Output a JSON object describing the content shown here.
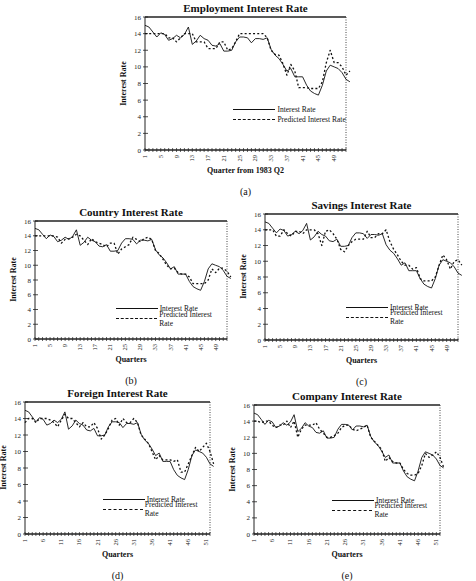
{
  "figure": {
    "captions": [
      "(a)",
      "(b)",
      "(c)",
      "(d)",
      "(e)"
    ]
  },
  "legend": {
    "actual": "Interest Rate",
    "predicted": "Predicted Interest Rate"
  },
  "chart_data": [
    {
      "id": "a",
      "type": "line",
      "title": "Employment Interest Rate",
      "xlabel": "Quarter from 1983 Q2",
      "ylabel": "Interest Rate",
      "caption": "(a)",
      "ylim": [
        0,
        16
      ],
      "yticks": [
        0,
        2,
        4,
        6,
        8,
        10,
        12,
        14,
        16
      ],
      "xlim": [
        1,
        52
      ],
      "xticks": [
        1,
        5,
        9,
        13,
        17,
        21,
        25,
        29,
        33,
        37,
        41,
        45,
        49
      ],
      "grid": false,
      "legend_position": "lower-center",
      "box": {
        "left": 145,
        "top": 17,
        "right": 346,
        "bottom": 150
      },
      "series": [
        {
          "name": "Interest Rate",
          "style": "solid",
          "values": [
            15.0,
            14.8,
            14.2,
            13.6,
            14.1,
            13.9,
            13.2,
            13.4,
            13.8,
            13.5,
            13.9,
            14.8,
            12.7,
            13.1,
            13.8,
            13.4,
            13.2,
            12.6,
            12.5,
            12.8,
            11.9,
            11.9,
            12.0,
            13.0,
            13.6,
            13.6,
            13.5,
            12.9,
            13.4,
            13.4,
            13.3,
            13.5,
            12.1,
            11.4,
            11.0,
            10.3,
            9.5,
            9.8,
            8.8,
            8.8,
            8.8,
            7.8,
            7.1,
            6.8,
            6.6,
            7.8,
            9.5,
            10.2,
            10.0,
            9.8,
            9.3,
            8.5,
            8.2
          ]
        },
        {
          "name": "Predicted Interest Rate",
          "style": "dashed",
          "values": [
            14.0,
            14.0,
            14.0,
            14.0,
            14.0,
            14.0,
            13.5,
            13.5,
            13.0,
            13.5,
            14.0,
            14.0,
            14.0,
            13.0,
            13.0,
            13.0,
            12.2,
            12.2,
            12.2,
            13.0,
            13.0,
            12.0,
            12.2,
            13.0,
            14.0,
            14.0,
            14.0,
            14.0,
            14.0,
            14.0,
            14.0,
            13.5,
            12.0,
            11.5,
            11.4,
            10.4,
            9.0,
            10.3,
            9.5,
            7.5,
            7.5,
            7.5,
            7.4,
            7.4,
            7.4,
            8.2,
            10.5,
            12.0,
            10.5,
            10.5,
            10.0,
            9.0,
            9.5
          ]
        }
      ]
    },
    {
      "id": "b",
      "type": "line",
      "title": "Country Interest Rate",
      "xlabel": "Quarters",
      "ylabel": "Interest Rate",
      "caption": "(b)",
      "ylim": [
        0,
        16
      ],
      "yticks": [
        0,
        2,
        4,
        6,
        8,
        10,
        12,
        14,
        16
      ],
      "xlim": [
        1,
        52
      ],
      "xticks": [
        1,
        5,
        9,
        13,
        17,
        21,
        25,
        29,
        33,
        37,
        41,
        45,
        49
      ],
      "grid": false,
      "legend_position": "lower-right",
      "box": {
        "left": 35,
        "top": 221,
        "right": 227,
        "bottom": 339
      },
      "series": [
        {
          "name": "Interest Rate",
          "style": "solid",
          "values": [
            15.0,
            14.8,
            14.2,
            13.6,
            14.1,
            13.9,
            13.2,
            13.4,
            13.8,
            13.5,
            13.9,
            14.8,
            12.7,
            13.1,
            13.8,
            13.4,
            13.2,
            12.6,
            12.5,
            12.8,
            11.9,
            11.9,
            12.0,
            13.0,
            13.6,
            13.6,
            13.5,
            12.9,
            13.4,
            13.4,
            13.3,
            13.5,
            12.1,
            11.4,
            11.0,
            10.3,
            9.5,
            9.8,
            8.8,
            8.8,
            8.8,
            7.8,
            7.1,
            6.8,
            6.6,
            7.8,
            9.5,
            10.2,
            10.0,
            9.8,
            9.3,
            8.5,
            8.2
          ]
        },
        {
          "name": "Predicted Interest Rate",
          "style": "dashed",
          "values": [
            14.0,
            14.0,
            14.0,
            14.0,
            14.0,
            14.0,
            13.8,
            13.0,
            13.5,
            13.6,
            13.8,
            14.2,
            14.0,
            13.4,
            12.8,
            13.6,
            13.2,
            13.0,
            12.8,
            12.5,
            13.0,
            13.0,
            11.5,
            12.2,
            12.5,
            12.8,
            13.8,
            13.5,
            13.2,
            13.6,
            13.8,
            13.5,
            12.0,
            11.6,
            10.8,
            10.0,
            9.5,
            9.6,
            9.0,
            8.8,
            8.8,
            8.4,
            7.5,
            7.5,
            7.5,
            7.5,
            8.0,
            9.5,
            9.0,
            9.6,
            9.6,
            9.2,
            8.4
          ]
        }
      ]
    },
    {
      "id": "c",
      "type": "line",
      "title": "Savings Interest Rate",
      "xlabel": "Quarters",
      "ylabel": "Interest Rate",
      "caption": "(c)",
      "ylim": [
        0,
        16
      ],
      "yticks": [
        0,
        2,
        4,
        6,
        8,
        10,
        12,
        14,
        16
      ],
      "xlim": [
        1,
        52
      ],
      "xticks": [
        1,
        5,
        9,
        13,
        17,
        21,
        25,
        29,
        33,
        37,
        41,
        45,
        49
      ],
      "grid": false,
      "legend_position": "lower-right",
      "box": {
        "left": 265,
        "top": 214,
        "right": 458,
        "bottom": 340
      },
      "series": [
        {
          "name": "Interest Rate",
          "style": "solid",
          "values": [
            15.0,
            14.8,
            14.2,
            13.6,
            14.1,
            13.9,
            13.2,
            13.4,
            13.8,
            13.5,
            13.9,
            14.8,
            12.7,
            13.1,
            13.8,
            13.4,
            13.2,
            12.6,
            12.5,
            12.8,
            11.9,
            11.9,
            12.0,
            13.0,
            13.6,
            13.6,
            13.5,
            12.9,
            13.4,
            13.4,
            13.3,
            13.5,
            12.1,
            11.4,
            11.0,
            10.3,
            9.5,
            9.8,
            8.8,
            8.8,
            8.8,
            7.8,
            7.1,
            6.8,
            6.6,
            7.8,
            9.5,
            10.2,
            10.0,
            9.8,
            9.3,
            8.5,
            8.2
          ]
        },
        {
          "name": "Predicted Interest Rate",
          "style": "dashed",
          "values": [
            14.0,
            14.0,
            14.0,
            13.2,
            13.2,
            14.0,
            13.5,
            13.2,
            13.8,
            13.8,
            13.5,
            14.0,
            14.0,
            14.0,
            13.5,
            12.0,
            13.8,
            14.0,
            13.5,
            12.8,
            11.5,
            11.2,
            12.0,
            12.5,
            12.8,
            12.8,
            12.8,
            13.8,
            13.0,
            13.0,
            13.5,
            13.5,
            14.0,
            12.5,
            11.5,
            10.8,
            10.0,
            9.5,
            9.5,
            9.0,
            9.2,
            7.8,
            7.5,
            7.5,
            7.5,
            8.0,
            9.5,
            10.8,
            10.2,
            9.0,
            10.0,
            10.2,
            9.5
          ]
        }
      ]
    },
    {
      "id": "d",
      "type": "line",
      "title": "Foreign Interest Rate",
      "xlabel": "Quarters",
      "ylabel": "Interest Rate",
      "caption": "(d)",
      "ylim": [
        0,
        16
      ],
      "yticks": [
        0,
        2,
        4,
        6,
        8,
        10,
        12,
        14,
        16
      ],
      "xlim": [
        1,
        52
      ],
      "xticks": [
        1,
        6,
        11,
        16,
        21,
        26,
        31,
        36,
        41,
        46,
        51
      ],
      "grid": false,
      "legend_position": "lower-right",
      "box": {
        "left": 25,
        "top": 402,
        "right": 210,
        "bottom": 534
      },
      "series": [
        {
          "name": "Interest Rate",
          "style": "solid",
          "values": [
            15.0,
            14.8,
            14.2,
            13.6,
            14.1,
            13.9,
            13.2,
            13.4,
            13.8,
            13.5,
            13.9,
            14.8,
            12.7,
            13.1,
            13.8,
            13.4,
            13.2,
            12.6,
            12.5,
            12.8,
            11.9,
            11.9,
            12.0,
            13.0,
            13.6,
            13.6,
            13.5,
            12.9,
            13.4,
            13.4,
            13.3,
            13.5,
            12.1,
            11.4,
            11.0,
            10.3,
            9.5,
            9.8,
            8.8,
            8.8,
            8.8,
            7.8,
            7.1,
            6.8,
            6.6,
            7.8,
            9.5,
            10.2,
            10.0,
            9.8,
            9.3,
            8.5,
            8.2
          ]
        },
        {
          "name": "Predicted Interest Rate",
          "style": "dashed",
          "values": [
            13.5,
            14.0,
            14.0,
            13.5,
            14.0,
            14.0,
            14.0,
            13.8,
            13.5,
            13.0,
            13.8,
            14.5,
            14.0,
            14.0,
            13.5,
            13.0,
            13.5,
            13.0,
            13.0,
            13.5,
            12.8,
            11.5,
            12.0,
            12.8,
            13.8,
            14.0,
            13.2,
            14.0,
            13.5,
            13.5,
            14.0,
            13.5,
            12.0,
            11.5,
            11.0,
            10.0,
            9.0,
            9.5,
            9.0,
            9.0,
            9.0,
            8.8,
            9.0,
            7.5,
            7.5,
            8.5,
            9.5,
            10.5,
            10.0,
            10.5,
            11.0,
            10.0,
            8.5
          ]
        }
      ]
    },
    {
      "id": "e",
      "type": "line",
      "title": "Company Interest Rate",
      "xlabel": "Quarters",
      "ylabel": "Interest Rate",
      "caption": "(e)",
      "ylim": [
        0,
        16
      ],
      "yticks": [
        0,
        2,
        4,
        6,
        8,
        10,
        12,
        14,
        16
      ],
      "xlim": [
        1,
        52
      ],
      "xticks": [
        1,
        6,
        11,
        16,
        21,
        26,
        31,
        36,
        41,
        46,
        51
      ],
      "grid": false,
      "legend_position": "lower-right",
      "box": {
        "left": 254,
        "top": 405,
        "right": 440,
        "bottom": 534
      },
      "series": [
        {
          "name": "Interest Rate",
          "style": "solid",
          "values": [
            15.0,
            14.8,
            14.2,
            13.6,
            14.1,
            13.9,
            13.2,
            13.4,
            13.8,
            13.5,
            13.9,
            14.8,
            12.7,
            13.1,
            13.8,
            13.4,
            13.2,
            12.6,
            12.5,
            12.8,
            11.9,
            11.9,
            12.0,
            13.0,
            13.6,
            13.6,
            13.5,
            12.9,
            13.4,
            13.4,
            13.3,
            13.5,
            12.1,
            11.4,
            11.0,
            10.3,
            9.5,
            9.8,
            8.8,
            8.8,
            8.8,
            7.8,
            7.1,
            6.8,
            6.6,
            7.8,
            9.5,
            10.2,
            10.0,
            9.8,
            9.3,
            8.5,
            8.2
          ]
        },
        {
          "name": "Predicted Interest Rate",
          "style": "dashed",
          "values": [
            14.0,
            14.0,
            13.8,
            14.0,
            14.0,
            13.5,
            13.2,
            13.5,
            13.5,
            14.0,
            13.2,
            14.0,
            12.0,
            13.0,
            13.5,
            13.5,
            13.5,
            13.8,
            13.0,
            12.5,
            12.0,
            12.0,
            12.2,
            12.5,
            13.2,
            13.5,
            13.5,
            13.0,
            12.8,
            13.0,
            13.2,
            13.5,
            12.0,
            11.5,
            11.0,
            10.5,
            9.0,
            9.5,
            9.0,
            8.8,
            8.8,
            8.0,
            7.5,
            7.3,
            7.3,
            7.5,
            8.5,
            10.0,
            9.5,
            9.8,
            10.2,
            9.5,
            8.3
          ]
        }
      ]
    }
  ]
}
